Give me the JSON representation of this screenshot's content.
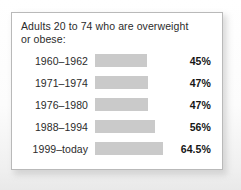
{
  "card": {
    "title": "Adults 20 to 74 who are overweight\nor obese:"
  },
  "colors": {
    "bar": "#cacaca",
    "card_background": "#ffffff",
    "card_border": "#b9b9b9",
    "text": "#2b2b2b",
    "value_text": "#161616"
  },
  "chart_data": {
    "type": "bar",
    "orientation": "horizontal",
    "title": "Adults 20 to 74 who are overweight or obese:",
    "xlabel": "",
    "ylabel": "",
    "categories": [
      "1960–1962",
      "1971–1974",
      "1976–1980",
      "1988–1994",
      "1999–today"
    ],
    "values": [
      45,
      47,
      47,
      56,
      64.5
    ],
    "value_labels": [
      "45%",
      "47%",
      "47%",
      "56%",
      "64.5%"
    ],
    "unit": "%",
    "grid": false,
    "legend": false,
    "bar_pixel_widths": [
      52,
      53,
      53,
      60,
      68
    ],
    "rows": [
      {
        "period": "1960–1962",
        "value": 45,
        "label": "45%",
        "bar_width": 52
      },
      {
        "period": "1971–1974",
        "value": 47,
        "label": "47%",
        "bar_width": 53
      },
      {
        "period": "1976–1980",
        "value": 47,
        "label": "47%",
        "bar_width": 53
      },
      {
        "period": "1988–1994",
        "value": 56,
        "label": "56%",
        "bar_width": 60
      },
      {
        "period": "1999–today",
        "value": 64.5,
        "label": "64.5%",
        "bar_width": 68
      }
    ]
  }
}
